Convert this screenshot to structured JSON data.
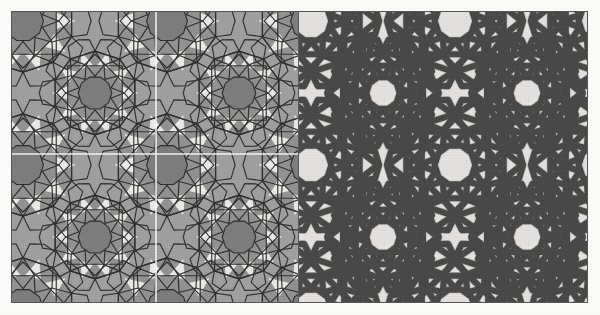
{
  "figure": {
    "page_background": "#fbfbfa",
    "frame_border_color": "#555555"
  },
  "panels": [
    {
      "id": "construction-panel",
      "label": "Underlying polygonal construction",
      "position": "left",
      "x": 11,
      "y": 11,
      "width": 286,
      "height": 290,
      "background_color": "#a2a2a2",
      "line_color": "#2b2b2b",
      "line_width": 1.15,
      "fills": {
        "rosette_shade": "#8b8b8b",
        "dark_accent": "#7d7d7d",
        "highlight": "#f2f2f0",
        "mid_highlight": "#cfcfcd"
      },
      "guides": {
        "color": "#ffffff",
        "width": 1.6,
        "vertical_x": [
          155
        ],
        "horizontal_y": [
          153
        ],
        "note": "white construction axes marking the translation unit"
      },
      "tiling": {
        "symmetry": "p4m-approximated tenfold rosette grid",
        "repeat_width": 144,
        "repeat_height": 144,
        "rosette_points": 10,
        "columns": 2,
        "rows": 2
      }
    },
    {
      "id": "strapwork-panel",
      "label": "Derived interlaced strapwork",
      "position": "right",
      "x": 298,
      "y": 11,
      "width": 289,
      "height": 290,
      "background_color": "#e6e5e3",
      "line_color": "#3f3f3f",
      "strap_width": 6.2,
      "strap_core_color": "#4a4a4a",
      "tiling": {
        "symmetry": "p4m-approximated tenfold rosette grid",
        "repeat_width": 144,
        "repeat_height": 144,
        "rosette_points": 10,
        "columns": 2,
        "rows": 2
      }
    }
  ],
  "divider": {
    "name": "panel-divider",
    "x": 297,
    "color": "#5a5a5a",
    "width": 1
  }
}
